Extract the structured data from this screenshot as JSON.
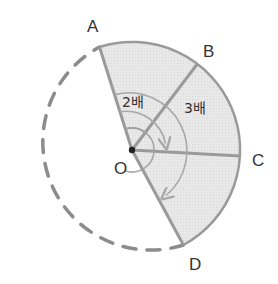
{
  "diagram": {
    "type": "circle-sector-angle",
    "center": {
      "label": "O",
      "x": 132,
      "y": 150
    },
    "radius": 108,
    "points": [
      {
        "label": "A",
        "angle_deg": 107.5,
        "label_x": 87,
        "label_y": 32
      },
      {
        "label": "B",
        "angle_deg": 52.8,
        "label_x": 203,
        "label_y": 57
      },
      {
        "label": "C",
        "angle_deg": -2.0,
        "label_x": 252,
        "label_y": 166
      },
      {
        "label": "D",
        "angle_deg": -61.6,
        "label_x": 189,
        "label_y": 270
      }
    ],
    "center_label": {
      "text": "O",
      "x": 114,
      "y": 174
    },
    "ratio_labels": [
      {
        "text": "2배",
        "x": 122,
        "y": 107,
        "meaning": "angle AOC is 2 times angle AOB"
      },
      {
        "text": "3배",
        "x": 184,
        "y": 113,
        "meaning": "angle AOD is 3 times angle AOB"
      }
    ],
    "arcs": [
      {
        "name": "arc-AOB",
        "radius": 22,
        "from": "A",
        "to": "B",
        "arrow": false
      },
      {
        "name": "arc-AOC",
        "radius": 40,
        "from": "A",
        "to": "C",
        "arrow": true
      },
      {
        "name": "arc-AOD",
        "radius": 58,
        "from": "A",
        "to": "D",
        "arrow": true
      }
    ],
    "colors": {
      "sector_fill": "#e6e6e6",
      "line": "#9a9a9a",
      "arc_line": "#a8a8a8",
      "dash": "#8c8c8c",
      "center_dot": "#222222",
      "text": "#333333"
    }
  }
}
